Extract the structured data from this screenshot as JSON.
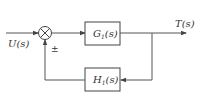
{
  "diagram": {
    "type": "block-diagram",
    "input_label": "U(s)",
    "output_label": "T(s)",
    "feedback_sign": "±",
    "forward_block": {
      "name": "G",
      "subscript": "1",
      "arg": "(s)"
    },
    "feedback_block": {
      "name": "H",
      "subscript": "1",
      "arg": "(s)"
    },
    "line_color": "#555555"
  }
}
